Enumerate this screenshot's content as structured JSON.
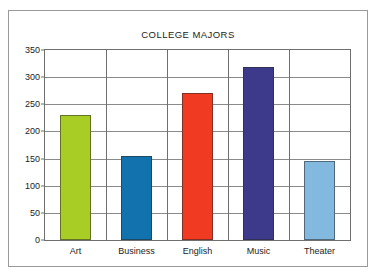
{
  "chart_data": {
    "type": "bar",
    "title": "COLLEGE MAJORS",
    "xlabel": "",
    "ylabel": "",
    "categories": [
      "Art",
      "Business",
      "English",
      "Music",
      "Theater"
    ],
    "values": [
      230,
      155,
      270,
      318,
      145
    ],
    "bar_colors": [
      "#A8CE26",
      "#1272AE",
      "#F03B22",
      "#3D3A8C",
      "#84B9DF"
    ],
    "ylim": [
      0,
      350
    ],
    "ytick_step": 50,
    "yticks": [
      0,
      50,
      100,
      150,
      200,
      250,
      300,
      350
    ],
    "ytick_labels": [
      "0",
      "50",
      "100",
      "150",
      "200",
      "250",
      "300",
      "350"
    ],
    "grid": "horizontal",
    "legend": "none",
    "series": [
      {
        "name": "Students",
        "values": [
          230,
          155,
          270,
          318,
          145
        ]
      }
    ]
  },
  "figure": {
    "frame_color": "#9a9a9a",
    "axis_color": "#6f6f6f",
    "gridline_color": "#8a8a8a",
    "background": "#ffffff"
  }
}
